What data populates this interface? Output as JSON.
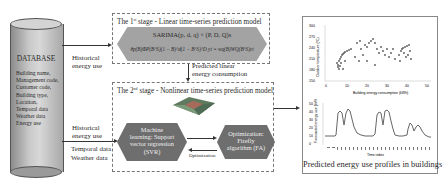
{
  "database": {
    "title": "DATABASE",
    "fields": [
      "Building name,",
      "Management code,",
      "Customer code,",
      "Building type,",
      "Location,",
      "Temporal data",
      "Weather data",
      "Energy use"
    ]
  },
  "inputs": {
    "historical_top_1": "Historical",
    "historical_top_2": "energy use",
    "historical_bottom_1": "Historical",
    "historical_bottom_2": "energy use",
    "temporal": "Temporal data",
    "weather": "Weather data"
  },
  "stage1": {
    "title_pre": "The 1",
    "title_sup": "st",
    "title_post": " stage  - Linear time-series prediction model",
    "formula_1": "SARIMA(p, d, q) × (P, D, Q)s",
    "formula_2": "θp(B)ΦP(B^S)(1 − B)^d(1 − B^S)^D yt = wq(B)WQ(B^S)εt"
  },
  "link": {
    "label_1": "Predicted linear",
    "label_2": "energy consumption"
  },
  "stage2": {
    "title_pre": "The 2",
    "title_sup": "nd",
    "title_post": " stage  - Nonlinear time-series prediction model",
    "svr_1": "Machine",
    "svr_2": "learning: Support",
    "svr_3": "vector regression",
    "svr_4": "(SVR)",
    "fa_1": "Optimization:",
    "fa_2": "Firefly",
    "fa_3": "algorithm (FA)",
    "optimization_label": "Optimization"
  },
  "output": {
    "caption": "Predicted energy use profiles in buildings",
    "scatter_xlabel": "Building energy consumption (kWh)",
    "scatter_ylabel": "Outdoor temperature (°C)",
    "scatter_yticks": [
      "300",
      "270",
      "240",
      "210",
      "180",
      "150"
    ],
    "scatter_xticks": [
      "0",
      "10",
      "20",
      "30",
      "40",
      "50"
    ],
    "line_xlabel": "Time index",
    "line_ylabel": "Forecasted energy use (kWh)",
    "line_yticks": [
      "50",
      "40",
      "30",
      "20",
      "10",
      "0"
    ]
  }
}
